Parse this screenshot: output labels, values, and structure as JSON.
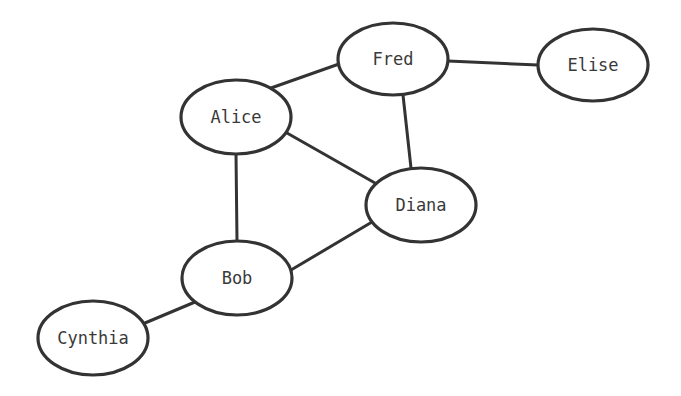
{
  "diagram": {
    "type": "undirected-graph",
    "stroke_color": "#333333",
    "background": "#ffffff",
    "nodes": [
      {
        "id": "fred",
        "label": "Fred",
        "cx": 393,
        "cy": 59,
        "rx": 55,
        "ry": 36
      },
      {
        "id": "elise",
        "label": "Elise",
        "cx": 593,
        "cy": 65,
        "rx": 55,
        "ry": 36
      },
      {
        "id": "alice",
        "label": "Alice",
        "cx": 236,
        "cy": 117,
        "rx": 55,
        "ry": 37
      },
      {
        "id": "diana",
        "label": "Diana",
        "cx": 421,
        "cy": 205,
        "rx": 55,
        "ry": 37
      },
      {
        "id": "bob",
        "label": "Bob",
        "cx": 237,
        "cy": 278,
        "rx": 55,
        "ry": 37
      },
      {
        "id": "cynthia",
        "label": "Cynthia",
        "cx": 93,
        "cy": 338,
        "rx": 55,
        "ry": 37
      }
    ],
    "edges": [
      {
        "from": "alice",
        "to": "fred",
        "x1": 271,
        "y1": 88,
        "x2": 339,
        "y2": 64
      },
      {
        "from": "fred",
        "to": "elise",
        "x1": 448,
        "y1": 61,
        "x2": 538,
        "y2": 65
      },
      {
        "from": "fred",
        "to": "diana",
        "x1": 403,
        "y1": 95,
        "x2": 411,
        "y2": 168
      },
      {
        "from": "alice",
        "to": "diana",
        "x1": 287,
        "y1": 133,
        "x2": 375,
        "y2": 183
      },
      {
        "from": "alice",
        "to": "bob",
        "x1": 236,
        "y1": 154,
        "x2": 237,
        "y2": 241
      },
      {
        "from": "bob",
        "to": "diana",
        "x1": 291,
        "y1": 270,
        "x2": 372,
        "y2": 222
      },
      {
        "from": "cynthia",
        "to": "bob",
        "x1": 145,
        "y1": 323,
        "x2": 195,
        "y2": 302
      }
    ]
  }
}
